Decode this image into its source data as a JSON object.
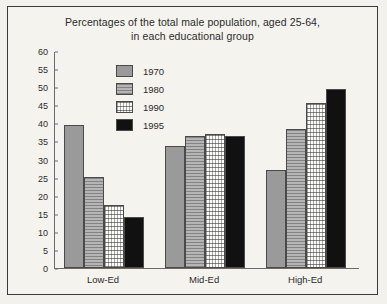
{
  "chart_data": {
    "type": "bar",
    "title": "Percentages of the total male population, aged 25-64, in each educational group",
    "title_line1": "Percentages of the total male population, aged 25-64,",
    "title_line2": "in each educational group",
    "xlabel": "",
    "ylabel": "",
    "ylim": [
      0,
      60
    ],
    "ytick_step": 5,
    "yticks": [
      60,
      55,
      50,
      45,
      40,
      35,
      30,
      25,
      20,
      15,
      10,
      5,
      0
    ],
    "grid": false,
    "legend_position": "inside-top-left",
    "categories": [
      "Low-Ed",
      "Mid-Ed",
      "High-Ed"
    ],
    "series": [
      {
        "name": "1970",
        "color": "#9a9a9a",
        "values": [
          39.5,
          33.8,
          27.0
        ]
      },
      {
        "name": "1980",
        "color": "#b5b5b5",
        "values": [
          25.3,
          36.5,
          38.3
        ]
      },
      {
        "name": "1990",
        "color": "#fbfbfa",
        "values": [
          17.3,
          37.0,
          45.5
        ]
      },
      {
        "name": "1995",
        "color": "#111111",
        "values": [
          14.0,
          36.5,
          49.5
        ]
      }
    ]
  }
}
